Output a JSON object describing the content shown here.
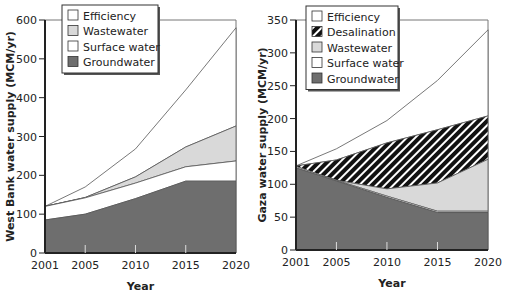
{
  "colors": {
    "groundwater": "#6e6e6e",
    "surface_water": "#ffffff",
    "wastewater": "#d9d9d9",
    "desalination": "hatch",
    "efficiency": "#ffffff",
    "axis": "#222222"
  },
  "chart_data": [
    {
      "type": "area",
      "stacked": true,
      "title": "",
      "xlabel": "Year",
      "ylabel": "West Bank water supply (MCM/yr)",
      "x": [
        2001,
        2005,
        2010,
        2015,
        2020
      ],
      "xticks": [
        "2001",
        "2005",
        "2010",
        "2015",
        "2020"
      ],
      "ylim": [
        0,
        600
      ],
      "yticks": [
        0,
        100,
        200,
        300,
        400,
        500,
        600
      ],
      "grid": false,
      "legend_position": "top-left inside",
      "legend": [
        "Efficiency",
        "Wastewater",
        "Surface water",
        "Groundwater"
      ],
      "series_cumulative_tops": [
        {
          "name": "Groundwater",
          "values": [
            85,
            100,
            140,
            185,
            185
          ]
        },
        {
          "name": "Surface water",
          "values": [
            120,
            142,
            180,
            222,
            237
          ]
        },
        {
          "name": "Wastewater",
          "values": [
            120,
            143,
            196,
            273,
            327
          ]
        },
        {
          "name": "Efficiency",
          "values": [
            120,
            170,
            268,
            420,
            580
          ]
        }
      ],
      "series": [
        {
          "name": "Groundwater",
          "values": [
            85,
            100,
            140,
            185,
            185
          ]
        },
        {
          "name": "Surface water",
          "values": [
            35,
            42,
            40,
            37,
            52
          ]
        },
        {
          "name": "Wastewater",
          "values": [
            0,
            1,
            16,
            51,
            90
          ]
        },
        {
          "name": "Efficiency",
          "values": [
            0,
            27,
            72,
            147,
            253
          ]
        }
      ]
    },
    {
      "type": "area",
      "stacked": true,
      "title": "",
      "xlabel": "Year",
      "ylabel": "Gaza water supply (MCM/yr)",
      "x": [
        2001,
        2005,
        2010,
        2015,
        2020
      ],
      "xticks": [
        "2001",
        "2005",
        "2010",
        "2015",
        "2020"
      ],
      "ylim": [
        0,
        350
      ],
      "yticks": [
        0,
        50,
        100,
        150,
        200,
        250,
        300,
        350
      ],
      "grid": false,
      "legend_position": "top-left inside",
      "legend": [
        "Efficiency",
        "Desalination",
        "Wastewater",
        "Surface water",
        "Groundwater"
      ],
      "series_cumulative_tops": [
        {
          "name": "Groundwater",
          "values": [
            125,
            105,
            80,
            57,
            57
          ]
        },
        {
          "name": "Surface water",
          "values": [
            127,
            106,
            82,
            59,
            59
          ]
        },
        {
          "name": "Wastewater",
          "values": [
            127,
            106,
            93,
            102,
            138
          ]
        },
        {
          "name": "Desalination",
          "values": [
            128,
            137,
            163,
            183,
            204
          ]
        },
        {
          "name": "Efficiency",
          "values": [
            128,
            154,
            197,
            258,
            335
          ]
        }
      ],
      "series": [
        {
          "name": "Groundwater",
          "values": [
            125,
            105,
            80,
            57,
            57
          ]
        },
        {
          "name": "Surface water",
          "values": [
            2,
            1,
            2,
            2,
            2
          ]
        },
        {
          "name": "Wastewater",
          "values": [
            0,
            0,
            11,
            43,
            79
          ]
        },
        {
          "name": "Desalination",
          "values": [
            1,
            31,
            70,
            81,
            66
          ]
        },
        {
          "name": "Efficiency",
          "values": [
            0,
            17,
            34,
            75,
            131
          ]
        }
      ]
    }
  ]
}
